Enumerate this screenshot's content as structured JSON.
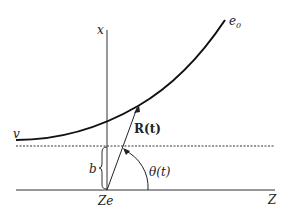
{
  "diagram": {
    "type": "scattering-trajectory",
    "labels": {
      "x_axis": "x",
      "z_axis": "Z",
      "nucleus": "Ze",
      "velocity": "v",
      "impact_parameter": "b",
      "position_vector": "R(t)",
      "angle": "θ(t)",
      "final_direction_base": "e",
      "final_direction_sub": "0"
    },
    "elements": [
      {
        "name": "trajectory-curve",
        "description": "hyperbolic path of incoming particle"
      },
      {
        "name": "x-axis",
        "description": "vertical axis through nucleus"
      },
      {
        "name": "z-axis",
        "description": "horizontal baseline axis"
      },
      {
        "name": "asymptote-dashed-line",
        "description": "dashed incoming asymptote at distance b"
      },
      {
        "name": "position-vector-arrow",
        "description": "R(t) from nucleus to particle"
      },
      {
        "name": "angle-arc",
        "description": "θ(t) between Z-axis and R(t)"
      },
      {
        "name": "impact-parameter-brace",
        "description": "brace marking b"
      }
    ],
    "colors": {
      "stroke": "#222222",
      "background": "#ffffff"
    }
  }
}
